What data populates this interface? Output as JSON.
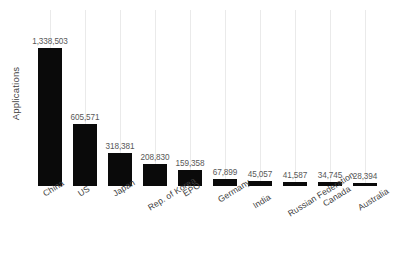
{
  "chart_data": {
    "type": "bar",
    "title": "",
    "subtitle": "",
    "xlabel": "",
    "ylabel": "Applications",
    "grid": "vertical-only",
    "legend": "none",
    "orientation": "vertical",
    "bar_color": "#0a0a0a",
    "gridline_color": "#eaeaea",
    "value_label_color": "#585858",
    "axis_label_color": "#3f3f3f",
    "background": "#ffffff",
    "ylim": [
      0,
      1338503
    ],
    "yticks_visible": false,
    "categories": [
      "China",
      "US",
      "Japan",
      "Rep. of Korea",
      "EPO",
      "Germany",
      "India",
      "Russian Federation",
      "Canada",
      "Australia"
    ],
    "values": [
      1338503,
      605571,
      318381,
      208830,
      159358,
      67899,
      45057,
      41587,
      34745,
      28394
    ],
    "value_labels": [
      "1,338,503",
      "605,571",
      "318,381",
      "208,830",
      "159,358",
      "67,899",
      "45,057",
      "41,587",
      "34,745",
      "28,394"
    ]
  },
  "bars": [
    {
      "category": "China",
      "value": 1338503,
      "label": "1,338,503"
    },
    {
      "category": "US",
      "value": 605571,
      "label": "605,571"
    },
    {
      "category": "Japan",
      "value": 318381,
      "label": "318,381"
    },
    {
      "category": "Rep. of Korea",
      "value": 208830,
      "label": "208,830"
    },
    {
      "category": "EPO",
      "value": 159358,
      "label": "159,358"
    },
    {
      "category": "Germany",
      "value": 67899,
      "label": "67,899"
    },
    {
      "category": "India",
      "value": 45057,
      "label": "45,057"
    },
    {
      "category": "Russian Federation",
      "value": 41587,
      "label": "41,587"
    },
    {
      "category": "Canada",
      "value": 34745,
      "label": "34,745"
    },
    {
      "category": "Australia",
      "value": 28394,
      "label": "28,394"
    }
  ],
  "axis": {
    "y_title": "Applications"
  }
}
